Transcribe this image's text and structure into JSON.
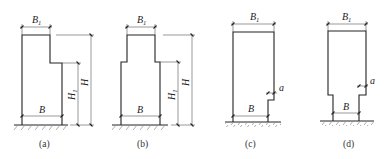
{
  "figure": {
    "panels": [
      {
        "id": "a",
        "caption": "(a)",
        "labels": {
          "top_width": "B",
          "top_width_sub": "1",
          "base_width": "B",
          "height": "H",
          "lower_height": "H",
          "lower_height_sub": "1"
        }
      },
      {
        "id": "b",
        "caption": "(b)",
        "labels": {
          "top_width": "B",
          "top_width_sub": "1",
          "base_width": "B",
          "height": "H",
          "lower_height": "H",
          "lower_height_sub": "1"
        }
      },
      {
        "id": "c",
        "caption": "(c)",
        "labels": {
          "top_width": "B",
          "top_width_sub": "1",
          "base_width": "B",
          "offset": "a"
        }
      },
      {
        "id": "d",
        "caption": "(d)",
        "labels": {
          "top_width": "B",
          "top_width_sub": "1",
          "base_width": "B",
          "offset": "a"
        }
      }
    ]
  }
}
